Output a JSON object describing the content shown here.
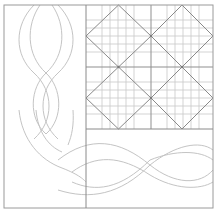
{
  "diagram": {
    "caption_cutoff": "",
    "regions": {
      "left_border": {
        "label": "cable-border-vertical",
        "pattern": "braided cable"
      },
      "grid_block": {
        "label": "diamond-grid-block",
        "blocks_across": 2,
        "blocks_down": 2,
        "pattern": "on-point diamonds over fine grid"
      },
      "bottom_border": {
        "label": "cable-border-horizontal",
        "pattern": "braided cable"
      }
    },
    "colors": {
      "frame": "#9a9a9a",
      "grid_fine": "#c8c8c8",
      "grid_major": "#8f8f8f",
      "diamond": "#8a8a8a",
      "cable": "#c4c4c4",
      "background": "#ffffff"
    }
  }
}
